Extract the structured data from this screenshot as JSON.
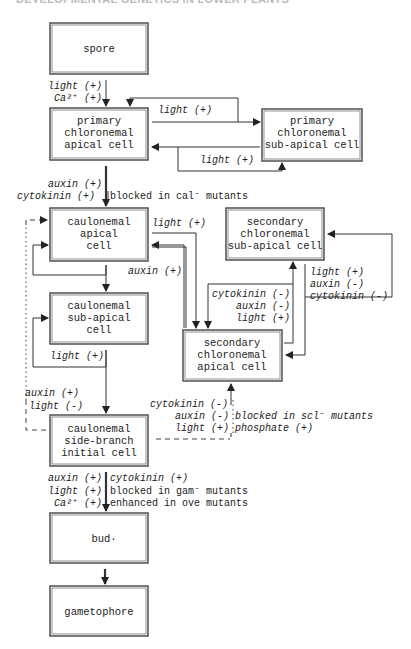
{
  "header": {
    "title": "DEVELOPMENTAL GENETICS IN LOWER PLANTS"
  },
  "nodes": {
    "spore": [
      "spore"
    ],
    "primary_apical": [
      "primary",
      "chloronemal",
      "apical cell"
    ],
    "primary_subapical": [
      "primary",
      "chloronemal",
      "sub-apical cell"
    ],
    "caulonemal_apical": [
      "caulonemal",
      "apical",
      "cell"
    ],
    "caulonemal_subapical": [
      "caulonemal",
      "sub-apical",
      "cell"
    ],
    "side_branch": [
      "caulonemal",
      "side-branch",
      "initial cell"
    ],
    "secondary_subapical": [
      "secondary",
      "chloronemal",
      "sub-apical cell"
    ],
    "secondary_apical": [
      "secondary",
      "chloronemal",
      "apical cell"
    ],
    "bud": [
      "bud·"
    ],
    "gametophore": [
      "gametophore"
    ]
  },
  "labels": {
    "spore_to_primary": [
      "light (+)",
      "Ca²⁺ (+)"
    ],
    "primary_to_subapical": "light (+)",
    "subapical_to_primary": "light (+)",
    "primary_to_caulonemal": [
      "auxin (+)",
      "cytokinin (+)"
    ],
    "primary_to_caulonemal_note": "blocked in cal⁻ mutants",
    "caulonemal_to_secondary_light": "light (+)",
    "secondary_to_caulonemal_auxin": "auxin (+)",
    "caul_subapical_loop": "light (+)",
    "side_branch_loop": [
      "auxin (+)",
      "light (-)"
    ],
    "sec_apical_to_subapical": [
      "cytokinin (-)",
      "auxin (-)",
      "light (+)"
    ],
    "sec_subapical_to_apical": [
      "light (+)",
      "auxin (-)",
      "cytokinin (-)"
    ],
    "side_to_secondary_left": [
      "cytokinin (-)",
      "auxin (-)",
      "light (+)"
    ],
    "side_to_secondary_right": [
      "blocked in scl⁻ mutants",
      "phosphate (+)"
    ],
    "side_to_bud_left": [
      "auxin (+)",
      "light (+)",
      "Ca²⁺ (+)"
    ],
    "side_to_bud_right": [
      "cytokinin (+)",
      "blocked in gam⁻ mutants",
      "enhanced in ove mutants"
    ]
  }
}
